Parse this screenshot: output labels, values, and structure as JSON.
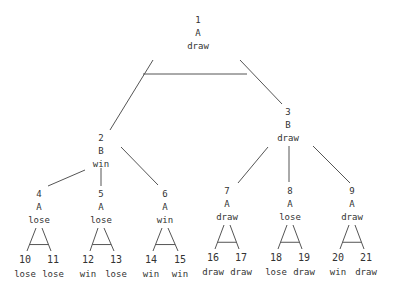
{
  "tree": {
    "line_color": "#555555",
    "text_color": "#333333",
    "nodes": [
      {
        "id": "1",
        "player": "A",
        "value": "draw",
        "x": 198,
        "y": 14
      },
      {
        "id": "2",
        "player": "B",
        "value": "win",
        "x": 101,
        "y": 132
      },
      {
        "id": "3",
        "player": "B",
        "value": "draw",
        "x": 288,
        "y": 106
      },
      {
        "id": "4",
        "player": "A",
        "value": "lose",
        "x": 39,
        "y": 188
      },
      {
        "id": "5",
        "player": "A",
        "value": "lose",
        "x": 101,
        "y": 188
      },
      {
        "id": "6",
        "player": "A",
        "value": "win",
        "x": 165,
        "y": 188
      },
      {
        "id": "7",
        "player": "A",
        "value": "draw",
        "x": 227,
        "y": 185
      },
      {
        "id": "8",
        "player": "A",
        "value": "lose",
        "x": 290,
        "y": 185
      },
      {
        "id": "9",
        "player": "A",
        "value": "draw",
        "x": 352,
        "y": 185
      }
    ],
    "leaves": [
      {
        "id": "10",
        "value": "lose",
        "x": 25,
        "y": 253
      },
      {
        "id": "11",
        "value": "lose",
        "x": 53,
        "y": 253
      },
      {
        "id": "12",
        "value": "win",
        "x": 88,
        "y": 253
      },
      {
        "id": "13",
        "value": "lose",
        "x": 116,
        "y": 253
      },
      {
        "id": "14",
        "value": "win",
        "x": 151,
        "y": 253
      },
      {
        "id": "15",
        "value": "win",
        "x": 180,
        "y": 253
      },
      {
        "id": "16",
        "value": "draw",
        "x": 213,
        "y": 251
      },
      {
        "id": "17",
        "value": "draw",
        "x": 241,
        "y": 251
      },
      {
        "id": "18",
        "value": "lose",
        "x": 276,
        "y": 251
      },
      {
        "id": "19",
        "value": "draw",
        "x": 304,
        "y": 251
      },
      {
        "id": "20",
        "value": "win",
        "x": 338,
        "y": 251
      },
      {
        "id": "21",
        "value": "draw",
        "x": 366,
        "y": 251
      }
    ],
    "edges": [
      {
        "from": "1",
        "to": "2",
        "x1": 153,
        "y1": 60,
        "x2": 110,
        "y2": 130
      },
      {
        "from": "1",
        "to": "3",
        "x1": 240,
        "y1": 60,
        "x2": 282,
        "y2": 104
      },
      {
        "from": "2",
        "to": "4",
        "x1": 85,
        "y1": 170,
        "x2": 48,
        "y2": 186
      },
      {
        "from": "2",
        "to": "5",
        "x1": 101,
        "y1": 168,
        "x2": 101,
        "y2": 186
      },
      {
        "from": "2",
        "to": "6",
        "x1": 121,
        "y1": 147,
        "x2": 158,
        "y2": 185
      },
      {
        "from": "3",
        "to": "7",
        "x1": 268,
        "y1": 147,
        "x2": 238,
        "y2": 183
      },
      {
        "from": "3",
        "to": "8",
        "x1": 289,
        "y1": 146,
        "x2": 289,
        "y2": 182
      },
      {
        "from": "3",
        "to": "9",
        "x1": 313,
        "y1": 146,
        "x2": 350,
        "y2": 183
      }
    ],
    "bars": [
      {
        "label": "root-and-bar",
        "x1": 143,
        "y1": 74,
        "x2": 247,
        "y2": 74
      }
    ]
  }
}
